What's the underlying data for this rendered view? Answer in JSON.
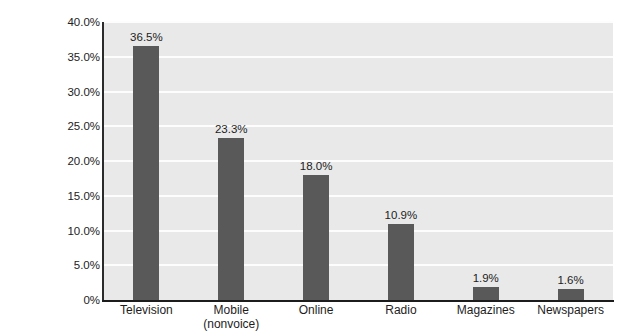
{
  "chart_data": {
    "type": "bar",
    "title": "",
    "xlabel": "",
    "ylabel": "",
    "categories": [
      "Television",
      "Mobile (nonvoice)",
      "Online",
      "Radio",
      "Magazines",
      "Newspapers"
    ],
    "category_lines": [
      [
        "Television"
      ],
      [
        "Mobile",
        "(nonvoice)"
      ],
      [
        "Online"
      ],
      [
        "Radio"
      ],
      [
        "Magazines"
      ],
      [
        "Newspapers"
      ]
    ],
    "values": [
      36.5,
      23.3,
      18.0,
      10.9,
      1.9,
      1.6
    ],
    "value_labels": [
      "36.5%",
      "23.3%",
      "18.0%",
      "10.9%",
      "1.9%",
      "1.6%"
    ],
    "ylim": [
      0,
      40
    ],
    "ytick_values": [
      40.0,
      35.0,
      30.0,
      25.0,
      20.0,
      15.0,
      10.0,
      5.0,
      0
    ],
    "ytick_labels": [
      "40.0%",
      "35.0%",
      "30.0%",
      "25.0%",
      "20.0%",
      "15.0%",
      "10.0%",
      "5.0%",
      "0%"
    ],
    "grid": true,
    "legend": false,
    "colors": {
      "bar": "#595959",
      "plot_background": "#e9e9e9",
      "gridline": "#fdfdfd",
      "axis": "#1c1c1c",
      "text": "#1d1d1d",
      "figure_background": "#ffffff"
    }
  }
}
